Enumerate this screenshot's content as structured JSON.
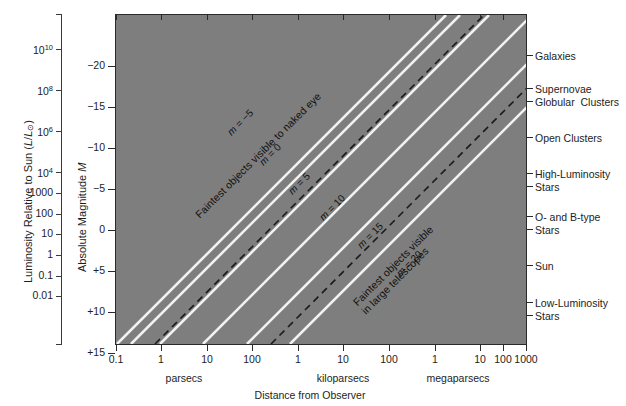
{
  "figure": {
    "background": "#ffffff",
    "plot_fill": "#7e7e7e",
    "line_color": "#f2f2f2",
    "dash_color": "#1a1a1a",
    "axis_color": "#2a2a2a"
  },
  "axes": {
    "x": {
      "title": "Distance from Observer",
      "type": "log",
      "ticks": [
        {
          "label": "0.1",
          "x": 116
        },
        {
          "label": "1",
          "x": 161
        },
        {
          "label": "10",
          "x": 207
        },
        {
          "label": "100",
          "x": 252
        },
        {
          "label": "1",
          "x": 298
        },
        {
          "label": "10",
          "x": 343
        },
        {
          "label": "100",
          "x": 389
        },
        {
          "label": "1",
          "x": 435
        },
        {
          "label": "10",
          "x": 480
        },
        {
          "label": "100",
          "x": 503
        },
        {
          "label": "1000",
          "x": 526
        }
      ],
      "groups": [
        {
          "label": "parsecs",
          "center": 184
        },
        {
          "label": "kiloparsecs",
          "center": 343
        },
        {
          "label": "megaparsecs",
          "center": 458
        }
      ]
    },
    "y_left": {
      "title_pre": "Luminosity Relative to Sun (",
      "title_l": "L",
      "title_slash": "/",
      "title_lsun": "L",
      "title_sun_sub": "⊙",
      "title_post": ")",
      "ticks": [
        {
          "label": "10",
          "exp": "10",
          "y": 49
        },
        {
          "label": "10",
          "exp": "8",
          "y": 90
        },
        {
          "label": "10",
          "exp": "6",
          "y": 131
        },
        {
          "label": "10",
          "exp": "4",
          "y": 172
        },
        {
          "label": "1000",
          "exp": "",
          "y": 193
        },
        {
          "label": "100",
          "exp": "",
          "y": 214
        },
        {
          "label": "10",
          "exp": "",
          "y": 234
        },
        {
          "label": "1",
          "exp": "",
          "y": 255
        },
        {
          "label": "0.1",
          "exp": "",
          "y": 276
        },
        {
          "label": "0.01",
          "exp": "",
          "y": 296
        }
      ]
    },
    "y_right_magnitude": {
      "title": "Absolute Magnitude ",
      "title_italic": "M",
      "ticks": [
        {
          "label": "−20",
          "y": 52
        },
        {
          "label": "−15",
          "y": 93
        },
        {
          "label": "−10",
          "y": 134
        },
        {
          "label": "−5",
          "y": 175
        },
        {
          "label": "0",
          "y": 216
        },
        {
          "label": "+5",
          "y": 257
        },
        {
          "label": "+10",
          "y": 298
        },
        {
          "label": "+15",
          "y": 339
        }
      ]
    }
  },
  "object_labels": [
    {
      "lines": [
        "Galaxies"
      ],
      "y": 50
    },
    {
      "lines": [
        "Supernovae",
        "Globular  Clusters"
      ],
      "y": 83
    },
    {
      "lines": [
        "Open Clusters"
      ],
      "y": 132
    },
    {
      "lines": [
        "High-Luminosity",
        "Stars"
      ],
      "y": 168
    },
    {
      "lines": [
        "O- and B-type",
        "Stars"
      ],
      "y": 211
    },
    {
      "lines": [
        "Sun"
      ],
      "y": 260
    },
    {
      "lines": [
        "Low-Luminosity",
        "Stars"
      ],
      "y": 297
    }
  ],
  "magnitude_lines": [
    {
      "id": "m-minus-5",
      "label_pre": "m",
      "label_post": " = −5",
      "apparent_magnitude": -5,
      "x_bottom": 117,
      "style": "solid",
      "label_x": 228,
      "label_y": 127
    },
    {
      "id": "m-0",
      "label_pre": "m",
      "label_post": " = 0",
      "apparent_magnitude": 0,
      "x_bottom": 131,
      "style": "solid",
      "label_x": 260,
      "label_y": 157
    },
    {
      "id": "m-5",
      "label_pre": "m",
      "label_post": " = 5",
      "apparent_magnitude": 5,
      "x_bottom": 160,
      "style": "solid",
      "label_x": 289,
      "label_y": 186
    },
    {
      "id": "m-10",
      "label_pre": "m",
      "label_post": " = 10",
      "apparent_magnitude": 10,
      "x_bottom": 203,
      "style": "solid",
      "label_x": 320,
      "label_y": 212
    },
    {
      "id": "m-15",
      "label_pre": "m",
      "label_post": " = 15",
      "apparent_magnitude": 15,
      "x_bottom": 247,
      "style": "solid",
      "label_x": 358,
      "label_y": 240
    },
    {
      "id": "m-20",
      "label_pre": "m",
      "label_post": " = 20",
      "apparent_magnitude": 20,
      "x_bottom": 290,
      "style": "solid",
      "label_x": 397,
      "label_y": 268
    }
  ],
  "dashed_lines": [
    {
      "id": "naked-eye-limit",
      "label": "Faintest objects visible to naked eye",
      "x_bottom": 155,
      "label_x": 196,
      "label_y": 209
    },
    {
      "id": "large-telescope-limit",
      "label_line1": "Faintest objects visible",
      "label_line2": "in large telescopes",
      "x_bottom": 271,
      "label_x": 358,
      "label_y": 295
    }
  ],
  "chart_data": {
    "type": "line",
    "title": "",
    "xlabel": "Distance from Observer",
    "ylabel": "Absolute Magnitude M  /  Luminosity Relative to Sun (L/L⊙)",
    "x_scale": "log",
    "x_unit_groups": [
      "parsecs",
      "kiloparsecs",
      "megaparsecs"
    ],
    "x_tick_labels": [
      "0.1",
      "1",
      "10",
      "100",
      "1",
      "10",
      "100",
      "1",
      "10",
      "100",
      "1000"
    ],
    "y_left_tick_labels": [
      "10^10",
      "10^8",
      "10^6",
      "10^4",
      "1000",
      "100",
      "10",
      "1",
      "0.1",
      "0.01"
    ],
    "y_right_tick_labels": [
      "−20",
      "−15",
      "−10",
      "−5",
      "0",
      "+5",
      "+10",
      "+15"
    ],
    "ylim_magnitude": [
      -22.2,
      15.7
    ],
    "grid": false,
    "legend": "none",
    "relation": "M = m - 5 log10(d/10pc)",
    "series": [
      {
        "name": "m = −5",
        "style": "solid",
        "apparent_magnitude": -5
      },
      {
        "name": "m = 0",
        "style": "solid",
        "apparent_magnitude": 0
      },
      {
        "name": "m = 5",
        "style": "solid",
        "apparent_magnitude": 5
      },
      {
        "name": "m = 10",
        "style": "solid",
        "apparent_magnitude": 10
      },
      {
        "name": "m = 15",
        "style": "solid",
        "apparent_magnitude": 15
      },
      {
        "name": "m = 20",
        "style": "solid",
        "apparent_magnitude": 20
      },
      {
        "name": "Faintest objects visible to naked eye",
        "style": "dashed",
        "apparent_magnitude": 6
      },
      {
        "name": "Faintest objects visible in large telescopes",
        "style": "dashed",
        "apparent_magnitude": 18
      }
    ],
    "annotations": [
      {
        "text": "Galaxies",
        "magnitude": -20.9
      },
      {
        "text": "Supernovae",
        "magnitude": -18.3
      },
      {
        "text": "Globular Clusters",
        "magnitude": -17.0
      },
      {
        "text": "Open Clusters",
        "magnitude": -13.7
      },
      {
        "text": "High-Luminosity Stars",
        "magnitude": -9.3
      },
      {
        "text": "O- and B-type Stars",
        "magnitude": -4.1
      },
      {
        "text": "Sun",
        "magnitude": 1.8
      },
      {
        "text": "Low-Luminosity Stars",
        "magnitude": 6.4
      }
    ]
  }
}
